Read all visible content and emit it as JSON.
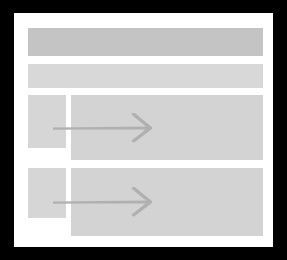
{
  "canvas": {
    "width": 287,
    "height": 260,
    "background_color": "#000000"
  },
  "page": {
    "background_color": "#ffffff",
    "label": "document-sheet"
  },
  "header": {
    "name": "header-placeholder-bar",
    "label": "",
    "color": "#c4c4c4"
  },
  "subheader": {
    "name": "subheader-placeholder-bar",
    "label": "",
    "color": "#d8d8d8"
  },
  "rows": [
    {
      "name": "content-row-1",
      "thumbnail": {
        "name": "thumbnail-placeholder-1",
        "label": "",
        "color": "#d6d6d6"
      },
      "panel": {
        "name": "content-panel-1",
        "label": "",
        "color": "#d3d3d3",
        "icon": "arrow-right-icon",
        "icon_color": "#b0b0b0"
      }
    },
    {
      "name": "content-row-2",
      "thumbnail": {
        "name": "thumbnail-placeholder-2",
        "label": "",
        "color": "#d6d6d6"
      },
      "panel": {
        "name": "content-panel-2",
        "label": "",
        "color": "#d3d3d3",
        "icon": "arrow-right-icon",
        "icon_color": "#b0b0b0"
      }
    }
  ]
}
